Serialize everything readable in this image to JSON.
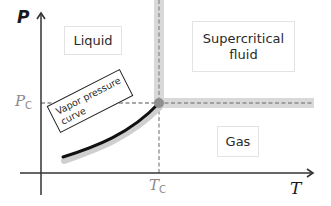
{
  "diagram": {
    "axes": {
      "y": {
        "symbol": "P",
        "name": "pressure"
      },
      "x": {
        "symbol": "T",
        "name": "temperature"
      }
    },
    "critical_point": {
      "pressure_symbol": "P",
      "pressure_subscript": "C",
      "temperature_symbol": "T",
      "temperature_subscript": "C"
    },
    "regions": {
      "liquid": "Liquid",
      "supercritical_line1": "Supercritical",
      "supercritical_line2": "fluid",
      "gas": "Gas"
    },
    "curve_label": {
      "line1": "Vapor pressure",
      "line2": "curve"
    },
    "colors": {
      "axis": "#333333",
      "band": "#d9d9d9",
      "dash": "#8c8c8c",
      "critical_point": "#8f8f8f",
      "curve": "#111111",
      "curve_shadow": "#cfcfcf",
      "label_muted": "#8a8a8a"
    }
  }
}
